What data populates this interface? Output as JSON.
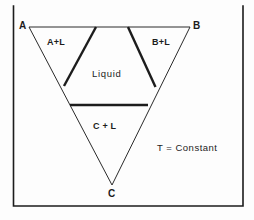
{
  "figure": {
    "kind": "ternary-phase-diagram",
    "background_color": "#fdfdfd",
    "line_color": "#1c1c1c",
    "frame": {
      "x": 13.5,
      "y": 6,
      "width": 229.5,
      "height": 200,
      "stroke_width": 1.6,
      "sides": "left-right-bottom"
    }
  },
  "chart_data": {
    "type": "diagram",
    "title": "",
    "subtitle": "",
    "xlabel": "",
    "ylabel": "",
    "grid": false,
    "legend_position": "none",
    "annotations": [
      "A",
      "B",
      "C",
      "A+L",
      "B+L",
      "Liquid",
      "C + L",
      "T = Constant"
    ]
  },
  "triangle": {
    "vertices": {
      "A": {
        "x": 29,
        "y": 27
      },
      "B": {
        "x": 190,
        "y": 27
      },
      "C": {
        "x": 112,
        "y": 185
      }
    },
    "stroke_width": 1.0
  },
  "boundaries": [
    {
      "name": "a-liquidus-boundary",
      "x1": 96,
      "y1": 27,
      "x2": 64,
      "y2": 86,
      "stroke_width": 2.4
    },
    {
      "name": "b-liquidus-boundary",
      "x1": 128,
      "y1": 27,
      "x2": 155.5,
      "y2": 87,
      "stroke_width": 2.4
    },
    {
      "name": "c-liquidus-tie-line",
      "x1": 70,
      "y1": 105,
      "x2": 148,
      "y2": 105,
      "stroke_width": 2.4
    }
  ],
  "labels": {
    "vertex_a": {
      "text": "A",
      "x": 19,
      "y": 21
    },
    "vertex_b": {
      "text": "B",
      "x": 193,
      "y": 21
    },
    "vertex_c": {
      "text": "C",
      "x": 108,
      "y": 189
    },
    "region_a_plus_l": {
      "text": "A+L",
      "x": 47,
      "y": 38
    },
    "region_b_plus_l": {
      "text": "B+L",
      "x": 152,
      "y": 38
    },
    "region_liquid": {
      "text": "Liquid",
      "x": 92,
      "y": 69
    },
    "region_c_plus_l": {
      "text": "C + L",
      "x": 93,
      "y": 122
    },
    "note_temperature": {
      "text": "T = Constant",
      "x": 157,
      "y": 143
    }
  }
}
